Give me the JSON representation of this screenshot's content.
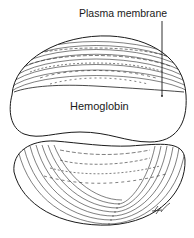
{
  "figure": {
    "labels": {
      "plasma_membrane": "Plasma membrane",
      "hemoglobin": "Hemoglobin"
    },
    "artist_mark": "JC",
    "colors": {
      "ink": "#1a1a1a",
      "background": "#ffffff"
    }
  }
}
